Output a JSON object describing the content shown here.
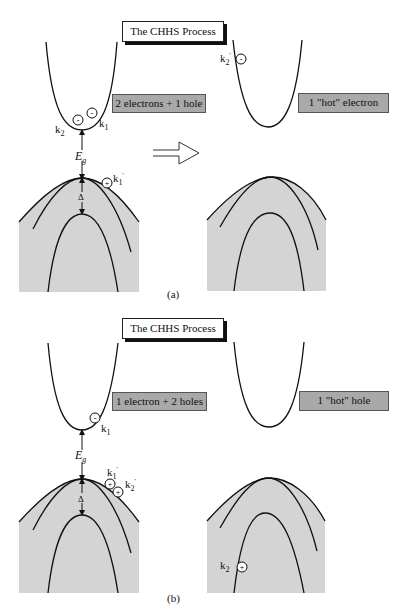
{
  "figure": {
    "panels": [
      {
        "id": "a",
        "caption": "(a)",
        "title": "The CHHS Process",
        "initial_state_label": "2 electrons + 1 hole",
        "final_state_label": "1 \"hot\" electron",
        "gap_label": "E",
        "gap_sub": "g",
        "split_label": "Δ",
        "initial_carriers": [
          {
            "type": "electron",
            "symbol": "-",
            "label": "k",
            "sub": "1",
            "prime": ""
          },
          {
            "type": "electron",
            "symbol": "-",
            "label": "k",
            "sub": "2",
            "prime": ""
          },
          {
            "type": "hole",
            "symbol": "+",
            "label": "k",
            "sub": "1",
            "prime": "'"
          }
        ],
        "final_carriers": [
          {
            "type": "electron",
            "symbol": "-",
            "label": "k",
            "sub": "2",
            "prime": "'"
          }
        ]
      },
      {
        "id": "b",
        "caption": "(b)",
        "title": "The CHHS Process",
        "initial_state_label": "1 electron + 2 holes",
        "final_state_label": "1 \"hot\" hole",
        "gap_label": "E",
        "gap_sub": "g",
        "split_label": "Δ",
        "initial_carriers": [
          {
            "type": "electron",
            "symbol": "-",
            "label": "k",
            "sub": "1",
            "prime": ""
          },
          {
            "type": "hole",
            "symbol": "+",
            "label": "k",
            "sub": "1",
            "prime": "'"
          },
          {
            "type": "hole",
            "symbol": "+",
            "label": "k",
            "sub": "2",
            "prime": "'"
          }
        ],
        "final_carriers": [
          {
            "type": "hole",
            "symbol": "+",
            "label": "k",
            "sub": "2",
            "prime": ""
          }
        ]
      }
    ],
    "transition_arrow": "hollow-right-arrow",
    "colors": {
      "valence_fill": "#d4d4d4",
      "label_box_fill": "#a9a9a9",
      "line": "#111111"
    }
  }
}
